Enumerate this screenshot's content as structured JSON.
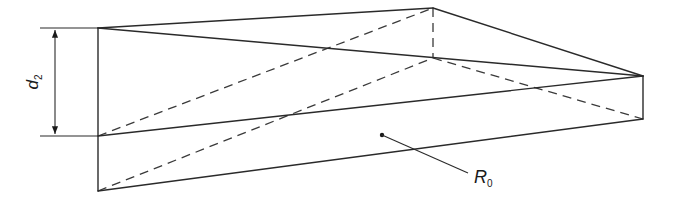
{
  "diagram": {
    "type": "wedge-prism-geometry",
    "labels": {
      "dimension_symbol": "d",
      "dimension_subscript": "2",
      "point_symbol": "R",
      "point_subscript": "0"
    },
    "vertices": {
      "A": [
        98,
        28
      ],
      "B": [
        98,
        136
      ],
      "C": [
        98,
        191
      ],
      "D": [
        433,
        8
      ],
      "E": [
        433,
        58
      ],
      "F": [
        643,
        76
      ],
      "G": [
        643,
        119
      ]
    },
    "solid_edges": [
      [
        "A",
        "B"
      ],
      [
        "B",
        "C"
      ],
      [
        "A",
        "D"
      ],
      [
        "D",
        "F"
      ],
      [
        "A",
        "F"
      ],
      [
        "B",
        "F"
      ],
      [
        "C",
        "G"
      ],
      [
        "F",
        "G"
      ]
    ],
    "hidden_edges": [
      [
        "D",
        "E"
      ],
      [
        "B",
        "D"
      ],
      [
        "C",
        "E"
      ],
      [
        "E",
        "G"
      ]
    ],
    "reference_point": [
      382,
      135
    ],
    "leader_end": [
      470,
      174
    ],
    "colors": {
      "line": "#2a2a2a",
      "background": "#ffffff"
    }
  }
}
